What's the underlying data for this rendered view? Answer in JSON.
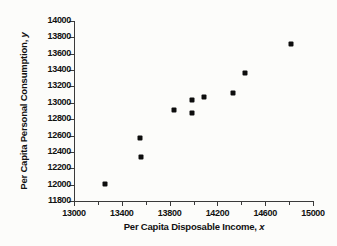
{
  "chart_data": {
    "type": "scatter",
    "title": "",
    "xlabel": "Per Capita Disposable Income, x",
    "ylabel": "Per Capita Personal Consumption, y",
    "xlim": [
      13000,
      15000
    ],
    "ylim": [
      11800,
      14000
    ],
    "grid": false,
    "legend": "none",
    "x_major_step": 400,
    "x_minor_step": 200,
    "y_major_step": 200,
    "xticks": [
      13000,
      13400,
      13800,
      14200,
      14600,
      15000
    ],
    "xtick_labels": [
      "13000",
      "13400",
      "13800",
      "14200",
      "14600",
      "15000"
    ],
    "x_minor_ticks": [
      13200,
      13600,
      14000,
      14400,
      14800
    ],
    "yticks": [
      11800,
      12000,
      12200,
      12400,
      12600,
      12800,
      13000,
      13200,
      13400,
      13600,
      13800,
      14000
    ],
    "ytick_labels": [
      "11800",
      "12000",
      "12200",
      "12400",
      "12600",
      "12800",
      "13000",
      "13200",
      "13400",
      "13600",
      "13800",
      "14000"
    ],
    "marker": "filled-square",
    "marker_color": "#0d0d0d",
    "points": [
      {
        "x": 13260,
        "y": 12010
      },
      {
        "x": 13550,
        "y": 12570
      },
      {
        "x": 13560,
        "y": 12340
      },
      {
        "x": 13840,
        "y": 12910
      },
      {
        "x": 13990,
        "y": 13030
      },
      {
        "x": 13990,
        "y": 12870
      },
      {
        "x": 14090,
        "y": 13070
      },
      {
        "x": 14330,
        "y": 13120
      },
      {
        "x": 14430,
        "y": 13370
      },
      {
        "x": 14820,
        "y": 13720
      }
    ]
  },
  "axis_titles": {
    "x_prefix": "Per Capita Disposable Income, ",
    "x_var": "x",
    "y_prefix": "Per Capita Personal Consumption, ",
    "y_var": "y"
  }
}
